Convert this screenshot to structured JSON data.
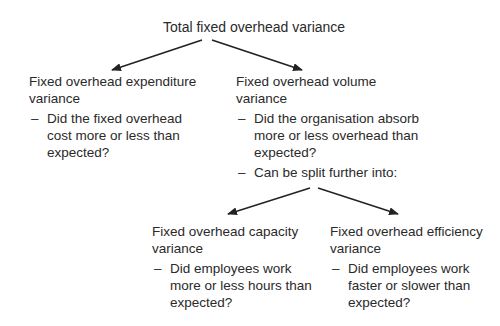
{
  "diagram": {
    "type": "tree",
    "root": {
      "title": "Total fixed overhead variance"
    },
    "expenditure": {
      "title_line1": "Fixed overhead expenditure",
      "title_line2": "variance",
      "points": [
        "Did the fixed overhead cost more or less than expected?"
      ]
    },
    "volume": {
      "title_line1": "Fixed overhead volume",
      "title_line2": "variance",
      "points": [
        "Did the organisation absorb more or less overhead than expected?",
        "Can be split further into:"
      ]
    },
    "capacity": {
      "title_line1": "Fixed overhead capacity",
      "title_line2": "variance",
      "points": [
        "Did employees work more or less hours than expected?"
      ]
    },
    "efficiency": {
      "title_line1": "Fixed overhead efficiency",
      "title_line2": "variance",
      "points": [
        "Did employees work faster or slower than expected?"
      ]
    },
    "bullet": "–",
    "edges": [
      {
        "from": "root",
        "to": "expenditure"
      },
      {
        "from": "root",
        "to": "volume"
      },
      {
        "from": "volume",
        "to": "capacity"
      },
      {
        "from": "volume",
        "to": "efficiency"
      }
    ],
    "colors": {
      "text": "#2a2a2a",
      "arrow": "#222222",
      "background": "#ffffff"
    }
  }
}
